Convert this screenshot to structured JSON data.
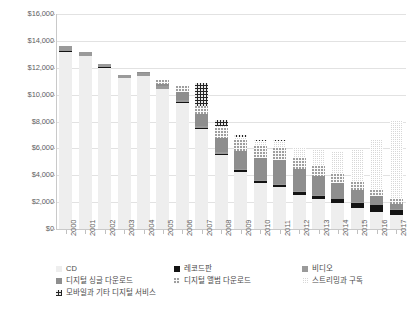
{
  "chart_data": {
    "type": "bar",
    "stacked": true,
    "title": "",
    "subtitle": "",
    "xlabel": "",
    "ylabel": "",
    "ylim": [
      0,
      16000
    ],
    "ytick_values": [
      0,
      2000,
      4000,
      6000,
      8000,
      10000,
      12000,
      14000,
      16000
    ],
    "ytick_labels": [
      "$0",
      "$2,000",
      "$4,000",
      "$6,000",
      "$8,000",
      "$10,000",
      "$12,000",
      "$14,000",
      "$16,000"
    ],
    "grid": true,
    "legend_position": "bottom",
    "categories": [
      "2000",
      "2001",
      "2002",
      "2003",
      "2004",
      "2005",
      "2006",
      "2007",
      "2008",
      "2009",
      "2010",
      "2011",
      "2012",
      "2013",
      "2014",
      "2015",
      "2016",
      "2017"
    ],
    "series": [
      {
        "name": "CD",
        "key": "cd",
        "pattern": "solid-light-gray",
        "color": "#eeeeee",
        "values": [
          13200,
          12850,
          12000,
          11250,
          11350,
          10400,
          9400,
          7450,
          5500,
          4250,
          3400,
          3100,
          2550,
          2200,
          1900,
          1550,
          1250,
          1050
        ]
      },
      {
        "name": "레코드판",
        "key": "vinyl",
        "pattern": "solid-black",
        "color": "#131313",
        "values": [
          30,
          30,
          30,
          25,
          25,
          25,
          30,
          60,
          90,
          110,
          160,
          200,
          240,
          280,
          330,
          420,
          520,
          400
        ]
      },
      {
        "name": "비디오",
        "key": "video",
        "pattern": "solid-medium-gray",
        "color": "#9a9a9a",
        "values": [
          380,
          330,
          250,
          220,
          220,
          200,
          190,
          150,
          120,
          90,
          70,
          60,
          50,
          40,
          30,
          25,
          20,
          15
        ]
      },
      {
        "name": "디지털 싱글 다운로드",
        "key": "digital_single",
        "pattern": "solid-dark-gray",
        "color": "#8e8e8e",
        "values": [
          0,
          0,
          0,
          0,
          60,
          180,
          600,
          900,
          1100,
          1350,
          1650,
          1750,
          1600,
          1400,
          1150,
          900,
          650,
          420
        ]
      },
      {
        "name": "디지털 앨범 다운로드",
        "key": "digital_album",
        "pattern": "dotted-light",
        "color": "#fbfbfb",
        "values": [
          0,
          0,
          0,
          0,
          0,
          250,
          450,
          600,
          720,
          800,
          880,
          900,
          870,
          800,
          700,
          580,
          450,
          330
        ]
      },
      {
        "name": "스트리밍과 구독",
        "key": "streaming",
        "pattern": "crosshatch-gray",
        "color": "#d7d7d7",
        "values": [
          0,
          0,
          0,
          0,
          0,
          0,
          0,
          0,
          150,
          220,
          380,
          560,
          800,
          1150,
          1650,
          2450,
          3800,
          5900
        ]
      },
      {
        "name": "모바일과 기타 디지털 서비스",
        "key": "mobile_other",
        "pattern": "dotted-black",
        "color": "#242424",
        "values": [
          0,
          0,
          0,
          0,
          0,
          0,
          0,
          1700,
          400,
          150,
          60,
          30,
          20,
          10,
          0,
          0,
          0,
          0
        ]
      }
    ]
  },
  "legend": {
    "items": [
      {
        "label": "CD",
        "key": "cd"
      },
      {
        "label": "레코드판",
        "key": "vinyl"
      },
      {
        "label": "비디오",
        "key": "video"
      },
      {
        "label": "디지털 싱글 다운로드",
        "key": "digital_single"
      },
      {
        "label": "디지털 앨범 다운로드",
        "key": "digital_album"
      },
      {
        "label": "스트리밍과 구독",
        "key": "streaming"
      },
      {
        "label": "모바일과 기타 디지털 서비스",
        "key": "mobile_other"
      }
    ]
  }
}
